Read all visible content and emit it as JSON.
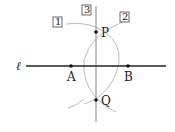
{
  "diagram": {
    "line_label": "ℓ",
    "points": {
      "A": {
        "label": "A"
      },
      "B": {
        "label": "B"
      },
      "P": {
        "label": "P"
      },
      "Q": {
        "label": "Q"
      }
    },
    "steps": [
      "1",
      "2",
      "3"
    ],
    "colors": {
      "main_line": "#222222",
      "construction": "#bbbbbb",
      "perpendicular": "#999999"
    }
  }
}
